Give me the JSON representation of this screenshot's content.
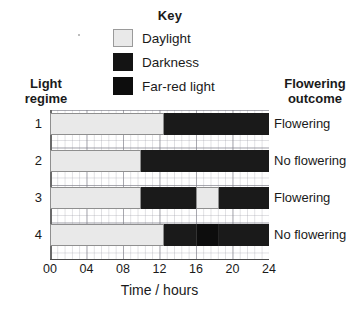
{
  "key": {
    "title": "Key",
    "items": [
      {
        "label": "Daylight",
        "icon": "swatch-daylight",
        "color": "#e9e9e9"
      },
      {
        "label": "Darkness",
        "icon": "swatch-darkness",
        "color": "#1a1a1a"
      },
      {
        "label": "Far-red light",
        "icon": "swatch-far-red-light",
        "color": "#0d0d0d"
      }
    ]
  },
  "headers": {
    "left": "Light\nregime",
    "left_line1": "Light",
    "left_line2": "regime",
    "right_line1": "Flowering",
    "right_line2": "outcome"
  },
  "axis": {
    "xlabel": "Time / hours",
    "ticks": [
      "00",
      "04",
      "08",
      "12",
      "16",
      "20",
      "24"
    ],
    "xmin": 0,
    "xmax": 24
  },
  "rows": [
    {
      "regime": "1",
      "outcome": "Flowering"
    },
    {
      "regime": "2",
      "outcome": "No flowering"
    },
    {
      "regime": "3",
      "outcome": "Flowering"
    },
    {
      "regime": "4",
      "outcome": "No flowering"
    }
  ],
  "chart_data": {
    "type": "bar",
    "title": "",
    "subtitle": "",
    "xlabel": "Time / hours",
    "ylabel": "Light regime",
    "xlim": [
      0,
      24
    ],
    "xticks": [
      0,
      4,
      8,
      12,
      16,
      20,
      24
    ],
    "xticklabels": [
      "00",
      "04",
      "08",
      "12",
      "16",
      "20",
      "24"
    ],
    "grid": true,
    "legend_position": "top-center",
    "orientation": "horizontal",
    "categories": [
      "1",
      "2",
      "3",
      "4"
    ],
    "legend": [
      "Daylight",
      "Darkness",
      "Far-red light"
    ],
    "colors": {
      "Daylight": "#e9e9e9",
      "Darkness": "#1a1a1a",
      "Far-red light": "#0d0d0d"
    },
    "series": [
      {
        "name": "1",
        "outcome": "Flowering",
        "segments": [
          {
            "type": "Daylight",
            "start": 0,
            "end": 12.5
          },
          {
            "type": "Darkness",
            "start": 12.5,
            "end": 24
          }
        ]
      },
      {
        "name": "2",
        "outcome": "No flowering",
        "segments": [
          {
            "type": "Daylight",
            "start": 0,
            "end": 10
          },
          {
            "type": "Darkness",
            "start": 10,
            "end": 24
          }
        ]
      },
      {
        "name": "3",
        "outcome": "Flowering",
        "segments": [
          {
            "type": "Daylight",
            "start": 0,
            "end": 10
          },
          {
            "type": "Darkness",
            "start": 10,
            "end": 16
          },
          {
            "type": "Daylight",
            "start": 16,
            "end": 18.5
          },
          {
            "type": "Darkness",
            "start": 18.5,
            "end": 24
          }
        ]
      },
      {
        "name": "4",
        "outcome": "No flowering",
        "segments": [
          {
            "type": "Daylight",
            "start": 0,
            "end": 12.5
          },
          {
            "type": "Darkness",
            "start": 12.5,
            "end": 16
          },
          {
            "type": "Far-red light",
            "start": 16,
            "end": 18.5
          },
          {
            "type": "Darkness",
            "start": 18.5,
            "end": 24
          }
        ]
      }
    ]
  }
}
